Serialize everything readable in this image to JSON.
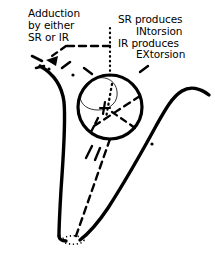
{
  "figure": {
    "type": "anatomical-diagram",
    "background_color": "#ffffff",
    "ink_color": "#000000"
  },
  "annotations": {
    "adduction_label": {
      "name": "adduction-label",
      "lines": [
        "Adduction",
        "by either",
        "SR or IR"
      ]
    },
    "torsion_label": {
      "name": "torsion-label",
      "lines": [
        "SR produces",
        "INtorsion",
        "IR produces",
        "EXtorsion"
      ]
    }
  },
  "graphics": {
    "globe": {
      "name": "eye-globe",
      "center_x": 110,
      "center_y": 107,
      "radius": 32,
      "stroke_width": 3.2
    },
    "cornea_arc": {
      "name": "cornea-limbus-arc",
      "stroke_width": 0.8
    },
    "orbit_wall_left": {
      "name": "orbit-wall-left",
      "stroke_width": 3.4
    },
    "orbit_wall_right": {
      "name": "orbit-wall-right",
      "stroke_width": 3.4
    },
    "orbit_floor": {
      "name": "orbit-floor",
      "stroke_width": 3.4
    },
    "annulus_of_zinn": {
      "name": "annulus-of-zinn-ellipse",
      "center_x": 73,
      "center_y": 240,
      "rx": 11,
      "ry": 4
    },
    "muscle_axis_line": {
      "name": "muscle-axis-dashed-line",
      "from_x": 110,
      "from_y": 139,
      "to_x": 74,
      "to_y": 238
    },
    "vertical_dotted_line": {
      "name": "vertical-dotted-pointer",
      "x": 110,
      "from_y": 28,
      "to_y": 78
    },
    "adduction_arrow": {
      "name": "adduction-dashed-arrow",
      "direction": "left"
    }
  }
}
